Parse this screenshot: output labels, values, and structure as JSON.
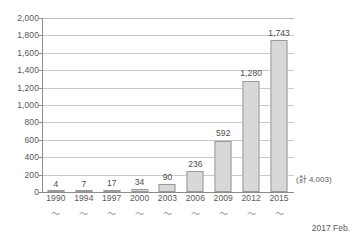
{
  "chart_data": {
    "type": "bar",
    "title": "",
    "subtitle": "",
    "xlabel": "",
    "ylabel": "",
    "categories": [
      "1990",
      "1994",
      "1997",
      "2000",
      "2003",
      "2006",
      "2009",
      "2012",
      "2015"
    ],
    "category_suffix": "〜",
    "values": [
      4,
      7,
      17,
      34,
      90,
      236,
      592,
      1280,
      1743
    ],
    "value_labels": [
      "4",
      "7",
      "17",
      "34",
      "90",
      "236",
      "592",
      "1,280",
      "1,743"
    ],
    "ylim": [
      0,
      2000
    ],
    "ytick_values": [
      0,
      200,
      400,
      600,
      800,
      1000,
      1200,
      1400,
      1600,
      1800,
      2000
    ],
    "ytick_labels": [
      "0",
      "200",
      "400",
      "600",
      "800",
      "1,000",
      "1,200",
      "1,400",
      "1,600",
      "1,800",
      "2,000"
    ],
    "grid": true,
    "legend": false,
    "annotations": [
      {
        "text": "(計 4,003)",
        "position": "baseline-right"
      }
    ],
    "footer": "2017 Feb.",
    "colors": {
      "bar_fill": "#d8d8d8",
      "bar_border": "#9a9a9a",
      "gridline": "#c9c9c9",
      "axis": "#8c8c8c",
      "text": "#595959",
      "background": "#ffffff"
    }
  }
}
